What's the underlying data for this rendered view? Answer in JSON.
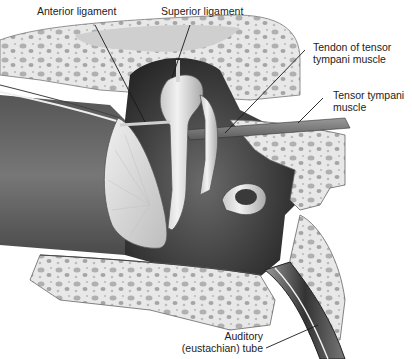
{
  "diagram": {
    "type": "anatomical-illustration",
    "labels": {
      "anterior_ligament": "Anterior ligament",
      "superior_ligament": "Superior ligament",
      "tendon_line1": "Tendon of tensor",
      "tendon_line2": "tympani muscle",
      "tensor_line1": "Tensor tympani",
      "tensor_line2": "muscle",
      "auditory_line1": "Auditory",
      "auditory_line2": "(eustachian) tube"
    },
    "colors": {
      "cavity": "#3a3a3a",
      "bone": "#e6e6e6",
      "bone_pore": "#a8a8a8",
      "ossicle": "#d8d8d8",
      "label_text": "#222222",
      "leader_line": "#1a1a1a"
    }
  }
}
